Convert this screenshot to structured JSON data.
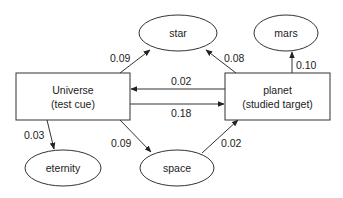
{
  "diagram": {
    "type": "network",
    "nodes": {
      "universe": {
        "line1": "Universe",
        "line2": "(test cue)",
        "shape": "rect"
      },
      "planet": {
        "line1": "planet",
        "line2": "(studied target)",
        "shape": "rect"
      },
      "star": {
        "label": "star",
        "shape": "ellipse"
      },
      "mars": {
        "label": "mars",
        "shape": "ellipse"
      },
      "eternity": {
        "label": "eternity",
        "shape": "ellipse"
      },
      "space": {
        "label": "space",
        "shape": "ellipse"
      }
    },
    "edges": {
      "universe_star": {
        "from": "Universe",
        "to": "star",
        "weight": "0.09"
      },
      "planet_star": {
        "from": "planet",
        "to": "star",
        "weight": "0.08"
      },
      "planet_mars": {
        "from": "planet",
        "to": "mars",
        "weight": "0.10"
      },
      "planet_universe": {
        "from": "planet",
        "to": "Universe",
        "weight": "0.02"
      },
      "universe_planet": {
        "from": "Universe",
        "to": "planet",
        "weight": "0.18"
      },
      "universe_eternity": {
        "from": "Universe",
        "to": "eternity",
        "weight": "0.03"
      },
      "universe_space": {
        "from": "Universe",
        "to": "space",
        "weight": "0.09"
      },
      "space_planet": {
        "from": "space",
        "to": "planet",
        "weight": "0.02"
      }
    }
  },
  "colors": {
    "stroke": "#333333",
    "text": "#222222",
    "background": "#ffffff"
  }
}
